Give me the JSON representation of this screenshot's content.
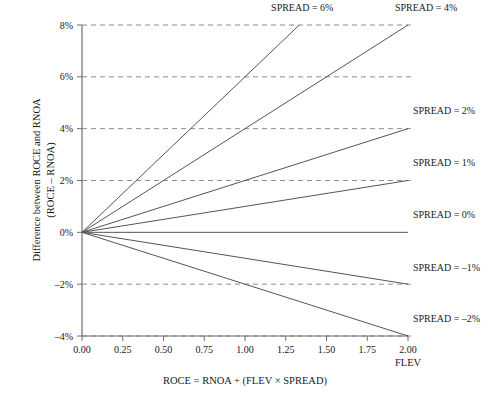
{
  "chart_data": {
    "type": "line",
    "title": "",
    "xlabel": "ROCE = RNOA + (FLEV × SPREAD)",
    "ylabel_line1": "Difference between ROCE and RNOA",
    "ylabel_line2": "(ROCE – RNOA)",
    "x_axis_unit_label": "FLEV",
    "xlim": [
      0.0,
      2.0
    ],
    "ylim": [
      -4,
      8
    ],
    "grid": "horizontal-dashed",
    "legend_position": "inline-right-of-line-ends",
    "xticks": [
      0.0,
      0.25,
      0.5,
      0.75,
      1.0,
      1.25,
      1.5,
      1.75,
      2.0
    ],
    "xticklabels": [
      "0.00",
      "0.25",
      "0.50",
      "0.75",
      "1.00",
      "1.25",
      "1.50",
      "1.75",
      "2.00"
    ],
    "yticks": [
      8,
      6,
      4,
      2,
      0,
      -2,
      -4
    ],
    "yticklabels": [
      "8%",
      "6%",
      "4%",
      "2%",
      "0%",
      "–2%",
      "–4%"
    ],
    "x": [
      0.0,
      2.0
    ],
    "series": [
      {
        "name": "SPREAD = 6%",
        "spread": 6,
        "x": [
          0.0,
          1.3333
        ],
        "values": [
          0,
          8
        ],
        "label": "SPREAD = 6%",
        "label_x": 1.16,
        "label_y": 8.55
      },
      {
        "name": "SPREAD = 4%",
        "spread": 4,
        "x": [
          0.0,
          2.0
        ],
        "values": [
          0,
          8
        ],
        "label": "SPREAD = 4%",
        "label_x": 1.92,
        "label_y": 8.55
      },
      {
        "name": "SPREAD = 2%",
        "spread": 2,
        "x": [
          0.0,
          2.0
        ],
        "values": [
          0,
          4
        ],
        "label": "SPREAD = 2%",
        "label_x": 2.03,
        "label_y": 4.55
      },
      {
        "name": "SPREAD = 1%",
        "spread": 1,
        "x": [
          0.0,
          2.0
        ],
        "values": [
          0,
          2
        ],
        "label": "SPREAD = 1%",
        "label_x": 2.03,
        "label_y": 2.55
      },
      {
        "name": "SPREAD = 0%",
        "spread": 0,
        "x": [
          0.0,
          2.0
        ],
        "values": [
          0,
          0
        ],
        "label": "SPREAD = 0%",
        "label_x": 2.03,
        "label_y": 0.55
      },
      {
        "name": "SPREAD = –1%",
        "spread": -1,
        "x": [
          0.0,
          2.0
        ],
        "values": [
          0,
          -2
        ],
        "label": "SPREAD = –1%",
        "label_x": 2.03,
        "label_y": -1.5
      },
      {
        "name": "SPREAD = –2%",
        "spread": -2,
        "x": [
          0.0,
          2.0
        ],
        "values": [
          0,
          -4
        ],
        "label": "SPREAD = –2%",
        "label_x": 2.03,
        "label_y": -3.45
      }
    ],
    "colors": {
      "line": "#555555",
      "axis": "#6e6e6e",
      "grid": "#8d8d8d",
      "text": "#1a1a1a",
      "background": "#ffffff"
    }
  }
}
